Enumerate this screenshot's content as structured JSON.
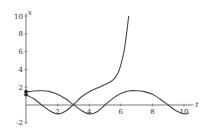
{
  "chart_data": {
    "type": "line",
    "title": "",
    "xlabel": "t",
    "ylabel": "x",
    "xlim": [
      0,
      10.5
    ],
    "ylim": [
      -2,
      10
    ],
    "grid": false,
    "legend": null,
    "x_ticks": [
      2,
      4,
      6,
      8,
      10
    ],
    "y_ticks": [
      -2,
      2,
      4,
      6,
      8,
      10
    ],
    "series": [
      {
        "name": "periodic-solution",
        "x": [
          0,
          0.5,
          1,
          1.5,
          2,
          2.5,
          3,
          3.5,
          4,
          4.5,
          5,
          5.5,
          6,
          6.5,
          7,
          7.5,
          8,
          8.5,
          9,
          9.5,
          10,
          10.3
        ],
        "values": [
          1.45,
          1.58,
          1.6,
          1.5,
          1.2,
          0.7,
          0.05,
          -0.6,
          -1.0,
          -0.75,
          0.0,
          0.75,
          1.3,
          1.58,
          1.6,
          1.5,
          1.2,
          0.65,
          0.0,
          -0.65,
          -1.0,
          -0.9
        ]
      },
      {
        "name": "blowup-solution",
        "x": [
          0,
          0.5,
          1,
          1.5,
          2,
          2.5,
          3,
          3.5,
          4,
          4.5,
          5,
          5.5,
          5.8,
          6.0,
          6.2,
          6.35,
          6.5
        ],
        "values": [
          1.15,
          0.7,
          0.0,
          -0.65,
          -1.0,
          -0.7,
          0.05,
          0.9,
          1.5,
          1.9,
          2.3,
          2.8,
          3.5,
          4.5,
          6.0,
          7.8,
          10.0
        ]
      }
    ],
    "markers": [
      {
        "x": 0,
        "y": 1.5
      },
      {
        "x": 0,
        "y": 1.15
      }
    ]
  },
  "axes": {
    "x_label": "t",
    "y_label": "x",
    "x_tick_labels": [
      "2",
      "4",
      "6",
      "8",
      "10"
    ],
    "y_tick_labels": [
      "10",
      "8",
      "6",
      "4",
      "2",
      "-2"
    ]
  }
}
